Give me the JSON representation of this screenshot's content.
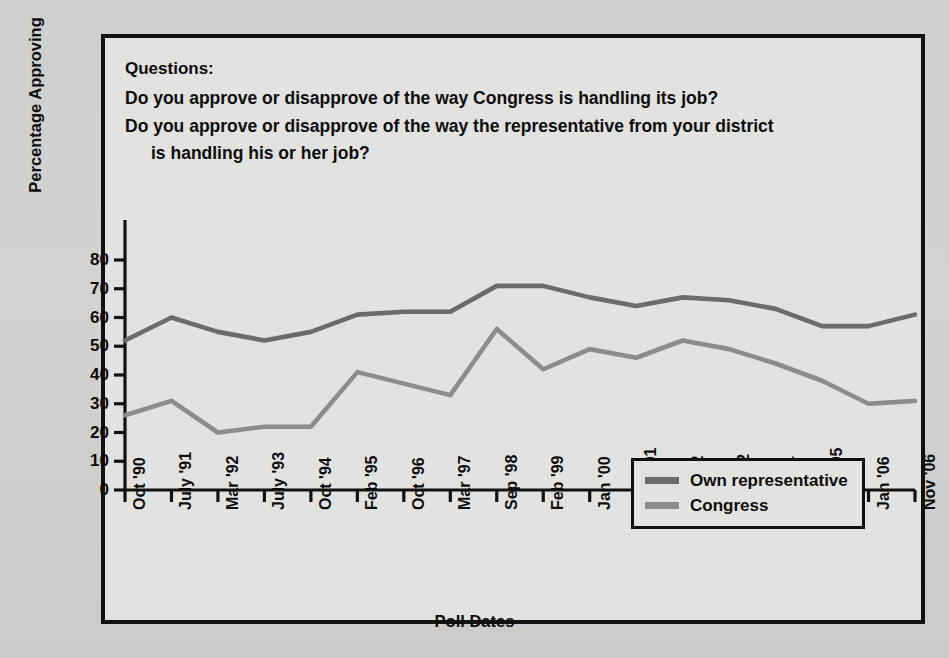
{
  "questions": {
    "heading": "Questions:",
    "items": [
      "Do you approve or disapprove of the way Congress is handling its job?",
      "Do you approve or disapprove of the way the representative from your district",
      "is handling his or her job?"
    ]
  },
  "legend": {
    "position": "inside-bottom-right",
    "items": [
      {
        "label": "Own representative",
        "color": "#6b6b6b"
      },
      {
        "label": "Congress",
        "color": "#8c8c8c"
      }
    ]
  },
  "colors": {
    "page_background": "#d2d2d0",
    "plot_background": "#e2e2e0",
    "frame": "#111111",
    "own_representative": "#6b6b6b",
    "congress": "#8c8c8c",
    "text": "#0d0d0d"
  },
  "chart_data": {
    "type": "line",
    "title": "",
    "xlabel": "Poll Dates",
    "ylabel": "Percentage Approving",
    "ylim": [
      0,
      80
    ],
    "yticks": [
      0,
      10,
      20,
      30,
      40,
      50,
      60,
      70,
      80
    ],
    "grid": false,
    "legend_position": "inside-bottom-right",
    "categories": [
      "Oct '90",
      "July '91",
      "Mar '92",
      "July '93",
      "Oct '94",
      "Feb '95",
      "Oct '96",
      "Mar '97",
      "Sep '98",
      "Feb '99",
      "Jan '00",
      "April '01",
      "Feb '02",
      "Nov '02",
      "Jan '04",
      "April '05",
      "Jan '06",
      "Nov '06"
    ],
    "series": [
      {
        "name": "Own representative",
        "color": "#6b6b6b",
        "values": [
          52,
          60,
          55,
          52,
          55,
          61,
          62,
          62,
          71,
          71,
          67,
          64,
          67,
          66,
          63,
          57,
          57,
          61
        ]
      },
      {
        "name": "Congress",
        "color": "#8c8c8c",
        "values": [
          26,
          31,
          20,
          22,
          22,
          41,
          37,
          33,
          56,
          42,
          49,
          46,
          52,
          49,
          44,
          38,
          30,
          31
        ]
      }
    ]
  }
}
